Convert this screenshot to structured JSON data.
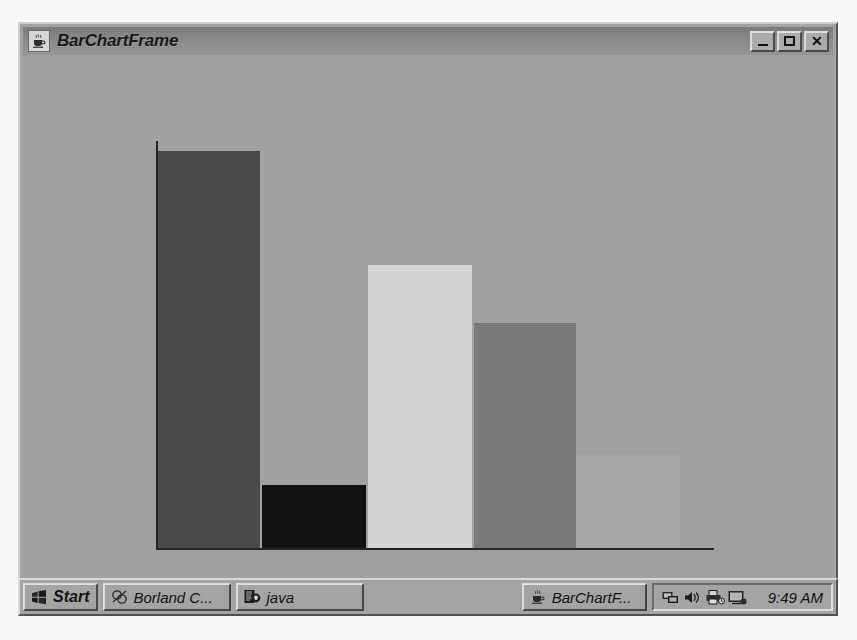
{
  "window": {
    "title": "BarChartFrame",
    "icon": "java-coffee-cup-icon",
    "buttons": {
      "minimize_label": "_",
      "maximize_label": "□",
      "close_label": "✕"
    }
  },
  "taskbar": {
    "start_label": "Start",
    "start_icon": "windows-flag-icon",
    "tasks": [
      {
        "label": "Borland C...",
        "icon": "borland-icon"
      },
      {
        "label": "java",
        "icon": "java-console-icon"
      },
      {
        "label": "BarChartF...",
        "icon": "java-coffee-cup-icon"
      }
    ],
    "tray": {
      "icons": [
        "network-icon",
        "volume-icon",
        "printer-icon",
        "display-icon"
      ],
      "clock": "9:49 AM"
    }
  },
  "chart_data": {
    "type": "bar",
    "title": "",
    "xlabel": "",
    "ylabel": "",
    "grid": false,
    "legend": false,
    "categories": [
      "1",
      "2",
      "3",
      "4",
      "5"
    ],
    "values": [
      100,
      16,
      65,
      50,
      23
    ],
    "ylim": [
      0,
      105
    ],
    "colors": [
      "#4c4c4c",
      "#121212",
      "#d9d9d9",
      "#7d7d7d",
      "#ababab"
    ],
    "axis_color": "#262626",
    "background": "#a5a5a5",
    "bars": [
      {
        "category": "1",
        "value": 100,
        "color": "#4c4c4c",
        "x": 133,
        "width": 104,
        "top": 96
      },
      {
        "category": "2",
        "value": 16,
        "color": "#121212",
        "x": 239,
        "width": 104,
        "top": 430
      },
      {
        "category": "3",
        "value": 65,
        "color": "#d9d9d9",
        "x": 345,
        "width": 104,
        "top": 210
      },
      {
        "category": "4",
        "value": 50,
        "color": "#7d7d7d",
        "x": 451,
        "width": 102,
        "top": 268
      },
      {
        "category": "5",
        "value": 23,
        "color": "#ababab",
        "x": 553,
        "width": 104,
        "top": 400
      }
    ]
  }
}
